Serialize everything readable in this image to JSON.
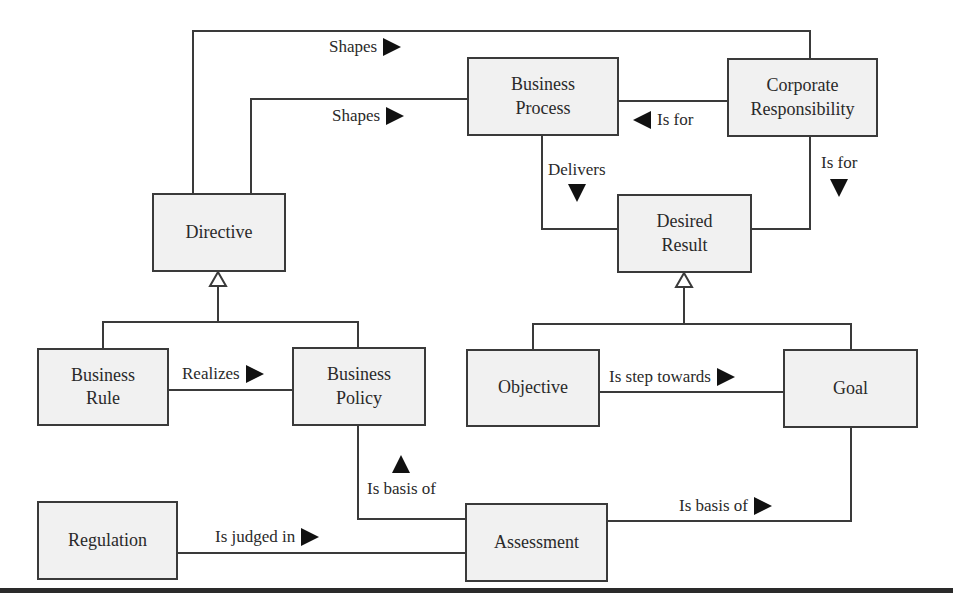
{
  "diagram": {
    "nodes": {
      "business_process": "Business Process",
      "business_process_l1": "Business",
      "business_process_l2": "Process",
      "corporate_responsibility_l1": "Corporate",
      "corporate_responsibility_l2": "Responsibility",
      "directive": "Directive",
      "desired_result_l1": "Desired",
      "desired_result_l2": "Result",
      "business_rule_l1": "Business",
      "business_rule_l2": "Rule",
      "business_policy_l1": "Business",
      "business_policy_l2": "Policy",
      "objective": "Objective",
      "goal": "Goal",
      "regulation": "Regulation",
      "assessment": "Assessment"
    },
    "edges": [
      {
        "from": "Directive",
        "to": "Corporate Responsibility",
        "label": "Shapes",
        "arrow": "right"
      },
      {
        "from": "Directive",
        "to": "Business Process",
        "label": "Shapes",
        "arrow": "right"
      },
      {
        "from": "Corporate Responsibility",
        "to": "Business Process",
        "label": "Is for",
        "arrow": "left"
      },
      {
        "from": "Business Process",
        "to": "Desired Result",
        "label": "Delivers",
        "arrow": "down"
      },
      {
        "from": "Corporate Responsibility",
        "to": "Desired Result",
        "label": "Is for",
        "arrow": "down"
      },
      {
        "from": "Business Rule",
        "to": "Business Policy",
        "label": "Realizes",
        "arrow": "right"
      },
      {
        "from": "Objective",
        "to": "Goal",
        "label": "Is step towards",
        "arrow": "right"
      },
      {
        "from": "Assessment",
        "to": "Business Policy",
        "label": "Is basis of",
        "arrow": "up"
      },
      {
        "from": "Assessment",
        "to": "Goal",
        "label": "Is basis of",
        "arrow": "right"
      },
      {
        "from": "Regulation",
        "to": "Assessment",
        "label": "Is judged in",
        "arrow": "right"
      }
    ],
    "generalizations": [
      {
        "parent": "Directive",
        "children": [
          "Business Rule",
          "Business Policy"
        ]
      },
      {
        "parent": "Desired Result",
        "children": [
          "Objective",
          "Goal"
        ]
      }
    ],
    "labels": {
      "shapes_top": "Shapes",
      "shapes_mid": "Shapes",
      "is_for_left": "Is for",
      "delivers": "Delivers",
      "is_for_down": "Is for",
      "realizes": "Realizes",
      "is_step_towards": "Is step towards",
      "is_basis_of_up": "Is basis of",
      "is_basis_of_right": "Is basis of",
      "is_judged_in": "Is judged in"
    },
    "colors": {
      "box_fill": "#f1f1f1",
      "line": "#3a3a3a",
      "arrow": "#111111"
    }
  }
}
